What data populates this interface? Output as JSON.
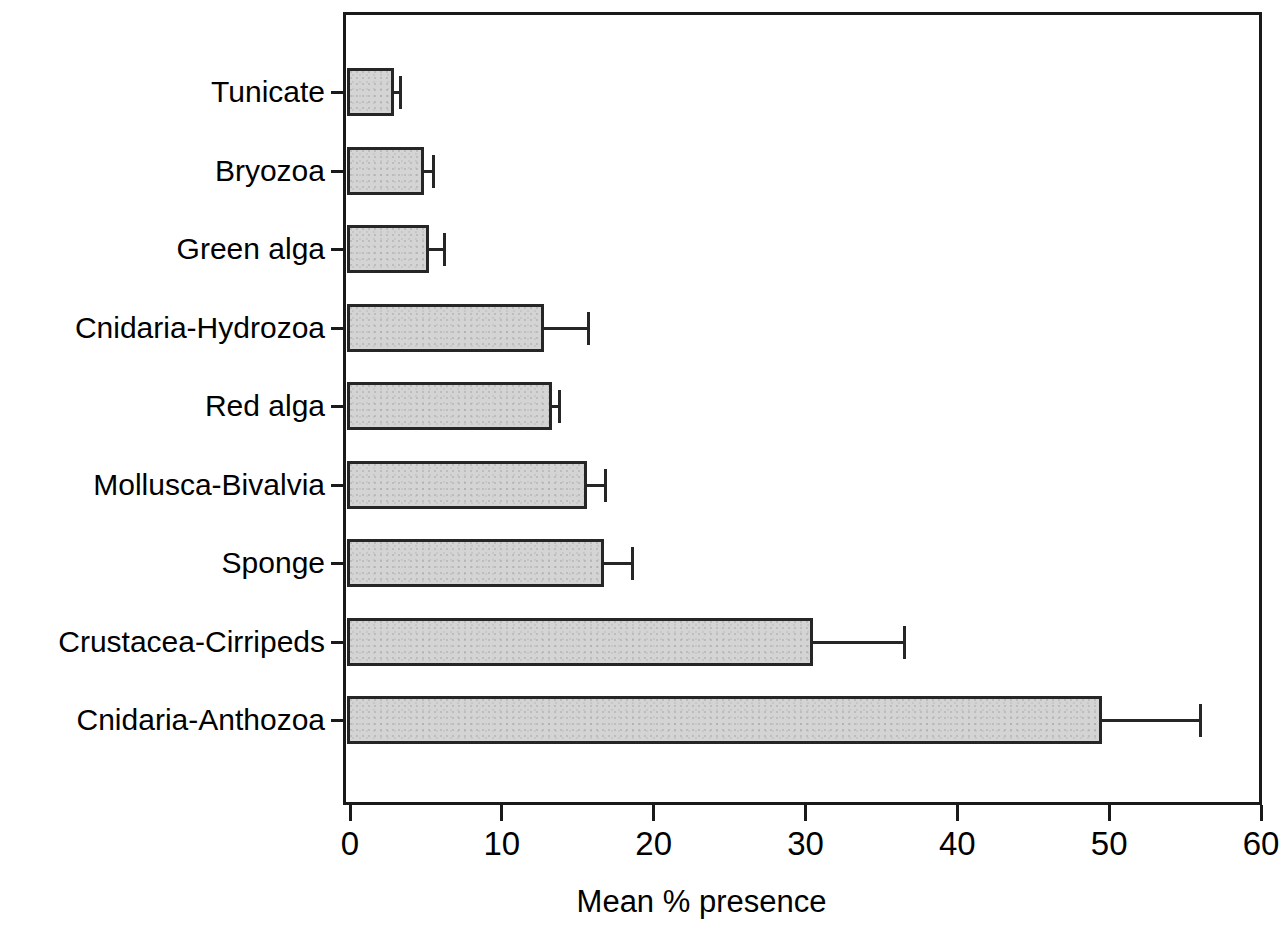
{
  "chart_data": {
    "type": "bar",
    "orientation": "horizontal",
    "title": "",
    "xlabel": "Mean % presence",
    "ylabel": "",
    "xlim": [
      0,
      60
    ],
    "xticks": [
      0,
      10,
      20,
      30,
      40,
      50,
      60
    ],
    "xtick_labels": [
      "0",
      "10",
      "20",
      "30",
      "40",
      "50",
      "60"
    ],
    "grid": false,
    "legend": null,
    "bar_color": "#d4d4d4",
    "bar_edge_color": "#262626",
    "axis_color": "#1a1a1a",
    "error_bars": "upper only (mean + SE)",
    "categories": [
      "Tunicate",
      "Bryozoa",
      "Green alga",
      "Cnidaria-Hydrozoa",
      "Red alga",
      "Mollusca-Bivalvia",
      "Sponge",
      "Crustacea-Cirripeds",
      "Cnidaria-Anthozoa"
    ],
    "values": [
      3.1,
      5.1,
      5.4,
      13.0,
      13.5,
      15.8,
      16.9,
      30.7,
      49.7
    ],
    "error_upper": [
      3.4,
      5.6,
      6.3,
      15.8,
      13.9,
      16.9,
      18.7,
      36.6,
      56.1
    ],
    "points": [
      {
        "category": "Tunicate",
        "value": 3.1,
        "error_upper": 3.4
      },
      {
        "category": "Bryozoa",
        "value": 5.1,
        "error_upper": 5.6
      },
      {
        "category": "Green alga",
        "value": 5.4,
        "error_upper": 6.3
      },
      {
        "category": "Cnidaria-Hydrozoa",
        "value": 13.0,
        "error_upper": 15.8
      },
      {
        "category": "Red alga",
        "value": 13.5,
        "error_upper": 13.9
      },
      {
        "category": "Mollusca-Bivalvia",
        "value": 15.8,
        "error_upper": 16.9
      },
      {
        "category": "Sponge",
        "value": 16.9,
        "error_upper": 18.7
      },
      {
        "category": "Crustacea-Cirripeds",
        "value": 30.7,
        "error_upper": 36.6
      },
      {
        "category": "Cnidaria-Anthozoa",
        "value": 49.7,
        "error_upper": 56.1
      }
    ]
  }
}
